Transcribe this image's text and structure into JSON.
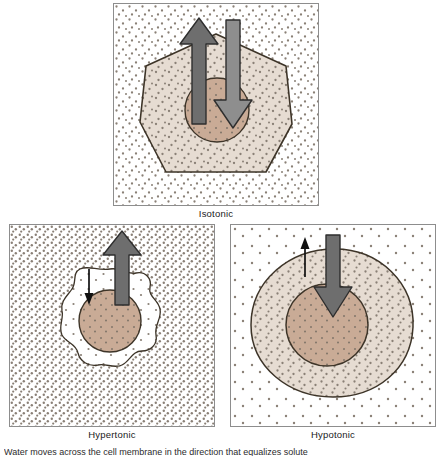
{
  "figure": {
    "background_color": "#ffffff",
    "panel_border_color": "#8d8d8d",
    "cytoplasm_color": "#e6dcd2",
    "nucleus_color": "#c9ab96",
    "membrane_color": "#3d3428",
    "stipple_color": "#8a8076",
    "thick_arrow_fill": "#6e6e6e",
    "thick_arrow_stroke": "#2e2e2e",
    "thin_arrow_color": "#111111"
  },
  "panels": [
    {
      "id": "isotonic",
      "label": "Isotonic",
      "cell_shape": "hexagon",
      "cell_state": "normal",
      "outside_solute_density": "medium",
      "inside_solute_density": "medium",
      "arrows": [
        {
          "direction": "up",
          "meaning": "water out of cell",
          "size": "large",
          "style": "thick"
        },
        {
          "direction": "down",
          "meaning": "water into cell",
          "size": "large",
          "style": "thick"
        }
      ],
      "net_water_movement": "none"
    },
    {
      "id": "hypertonic",
      "label": "Hypertonic",
      "cell_shape": "crenated",
      "cell_state": "shriveled",
      "outside_solute_density": "high",
      "inside_solute_density": "low",
      "arrows": [
        {
          "direction": "down",
          "meaning": "water into cell",
          "size": "small",
          "style": "thin"
        },
        {
          "direction": "up",
          "meaning": "water out of cell",
          "size": "large",
          "style": "thick"
        }
      ],
      "net_water_movement": "out of cell"
    },
    {
      "id": "hypotonic",
      "label": "Hypotonic",
      "cell_shape": "round",
      "cell_state": "swollen",
      "outside_solute_density": "low",
      "inside_solute_density": "high",
      "arrows": [
        {
          "direction": "up",
          "meaning": "water out of cell",
          "size": "small",
          "style": "thin"
        },
        {
          "direction": "down",
          "meaning": "water into cell",
          "size": "large",
          "style": "thick"
        }
      ],
      "net_water_movement": "into cell"
    }
  ],
  "bottom_caption": "Water moves across the cell membrane in the direction that equalizes solute"
}
